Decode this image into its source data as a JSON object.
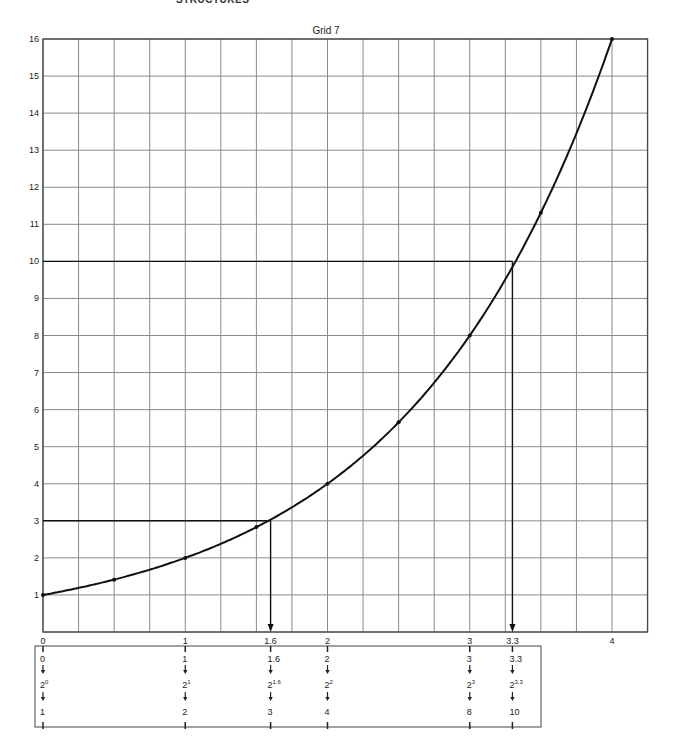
{
  "page": {
    "header": "STRUCTURES"
  },
  "chart_data": {
    "type": "line",
    "title": "Grid 7",
    "xlabel": "",
    "ylabel": "",
    "xlim": [
      0,
      4.25
    ],
    "ylim": [
      0,
      16
    ],
    "grid": true,
    "x_grid_step": 0.25,
    "y_grid_step": 1,
    "x_tick_labels": [
      "0",
      "1",
      "1.6",
      "2",
      "3",
      "3.3",
      "4"
    ],
    "x_tick_positions": [
      0,
      1,
      1.6,
      2,
      3,
      3.3,
      4
    ],
    "y_tick_labels": [
      "1",
      "2",
      "3",
      "4",
      "5",
      "6",
      "7",
      "8",
      "9",
      "10",
      "11",
      "12",
      "13",
      "14",
      "15",
      "16"
    ],
    "series": [
      {
        "name": "y = 2^x",
        "x": [
          0,
          0.5,
          1,
          1.5,
          2,
          2.5,
          3,
          3.5,
          4
        ],
        "y": [
          1,
          1.41,
          2,
          2.83,
          4,
          5.66,
          8,
          11.31,
          16
        ]
      }
    ],
    "annotations": [
      {
        "label": "2^1.6 ≈ 3",
        "x": 1.6,
        "y": 3
      },
      {
        "label": "2^3.3 ≈ 10",
        "x": 3.3,
        "y": 10
      }
    ],
    "table": {
      "columns": [
        {
          "x": 0,
          "exponent": "0",
          "base": "2",
          "power": "0",
          "result": "1"
        },
        {
          "x": 1,
          "exponent": "1",
          "base": "2",
          "power": "1",
          "result": "2"
        },
        {
          "x": 1.6,
          "exponent": "1.6",
          "base": "2",
          "power": "1.6",
          "result": "3"
        },
        {
          "x": 2,
          "exponent": "2",
          "base": "2",
          "power": "2",
          "result": "4"
        },
        {
          "x": 3,
          "exponent": "3",
          "base": "2",
          "power": "3",
          "result": "8"
        },
        {
          "x": 3.3,
          "exponent": "3.3",
          "base": "2",
          "power": "3.3",
          "result": "10"
        }
      ]
    }
  },
  "style": {
    "grid_color": "#8a8a8a",
    "line_color": "#111111",
    "border_color": "#444444"
  }
}
